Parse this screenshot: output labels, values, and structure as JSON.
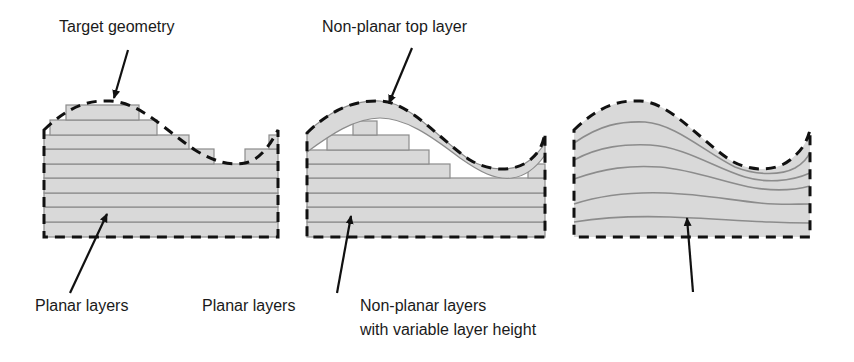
{
  "panels": [
    {
      "id": "planar",
      "top_label": "Target geometry",
      "bottom_label": "Planar layers"
    },
    {
      "id": "planar-with-nonplanar-top",
      "top_label": "Non-planar top layer",
      "bottom_label": "Planar layers"
    },
    {
      "id": "nonplanar",
      "bottom_label_line1": "Non-planar layers",
      "bottom_label_line2": "with variable layer height"
    }
  ],
  "colors": {
    "fill": "#d9d9d9",
    "layer_line": "#8c8c8c",
    "outline": "#111111",
    "text": "#1a1a1a"
  }
}
